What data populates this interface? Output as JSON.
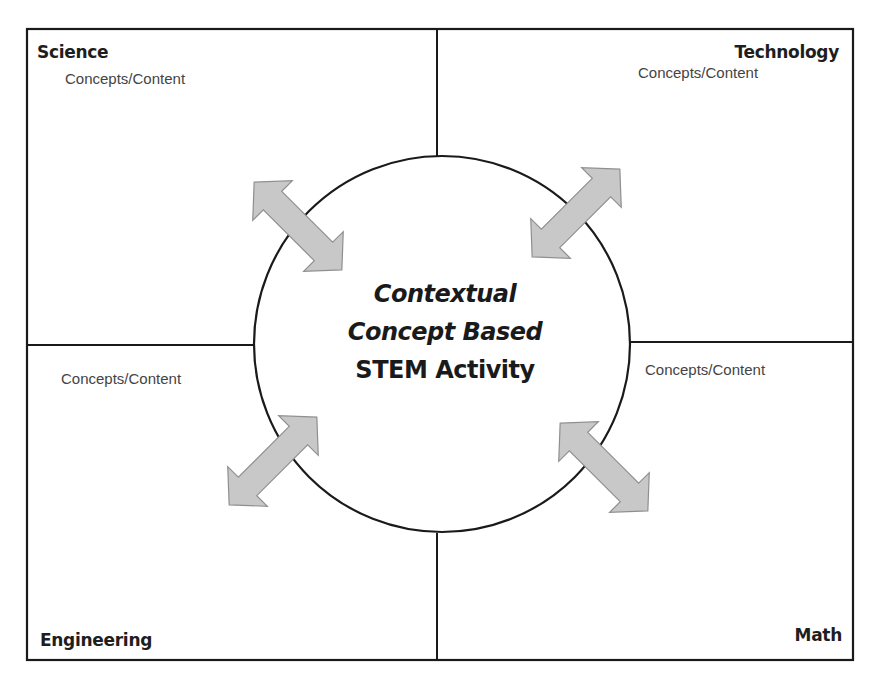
{
  "diagram": {
    "quadrants": [
      {
        "id": "science",
        "title": "Science",
        "content_label": "Concepts/Content"
      },
      {
        "id": "technology",
        "title": "Technology",
        "content_label": "Concepts/Content"
      },
      {
        "id": "engineering",
        "title": "Engineering",
        "content_label": "Concepts/Content"
      },
      {
        "id": "math",
        "title": "Math",
        "content_label": "Concepts/Content"
      }
    ],
    "center": {
      "line1": "Contextual",
      "line2": "Concept Based",
      "line3": "STEM Activity"
    },
    "arrows": [
      "bidirectional-arrow-top-left",
      "bidirectional-arrow-top-right",
      "bidirectional-arrow-bottom-left",
      "bidirectional-arrow-bottom-right"
    ],
    "colors": {
      "line": "#1a1a1a",
      "arrow_fill": "#c8c8c8",
      "arrow_stroke": "#8a8a8a",
      "background": "#ffffff"
    }
  }
}
